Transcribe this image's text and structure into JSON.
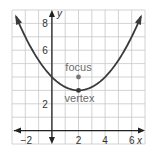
{
  "chart_data": {
    "type": "line",
    "title": "",
    "xlabel": "x",
    "ylabel": "y",
    "xlim": [
      -3,
      7
    ],
    "ylim": [
      -1,
      9
    ],
    "grid": true,
    "x_ticks": [
      -2,
      2,
      4,
      6
    ],
    "x_tick_labels": [
      "−2",
      "2",
      "4",
      "6"
    ],
    "y_ticks": [
      2,
      6,
      8
    ],
    "y_tick_labels": [
      "2",
      "6",
      "8"
    ],
    "series": [
      {
        "name": "parabola",
        "equation": "y = (1/4)(x - 2)^2 + 3",
        "vertex_form": {
          "a": 0.25,
          "h": 2,
          "k": 3
        },
        "x_range": [
          -2.7,
          6.7
        ],
        "arrows_at_ends": true
      }
    ],
    "points": [
      {
        "name": "focus",
        "label": "focus",
        "x": 2,
        "y": 4
      },
      {
        "name": "vertex",
        "label": "vertex",
        "x": 2,
        "y": 3
      }
    ],
    "colors": {
      "curve": "#3a3a3a",
      "grid": "#c8c8c8",
      "axis": "#222222",
      "annotation": "#6b6b6b"
    }
  }
}
